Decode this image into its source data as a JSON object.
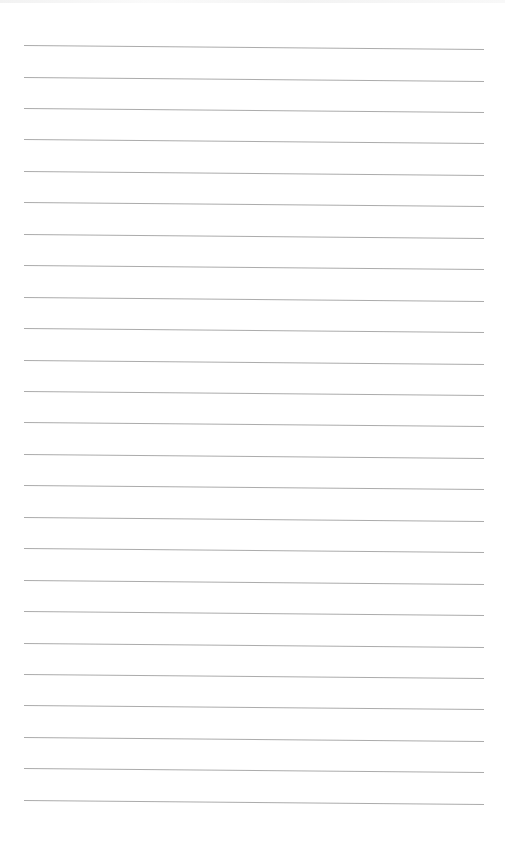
{
  "page": {
    "type": "lined-paper",
    "background": "#ffffff",
    "line_color": "#9c9c9c",
    "line_count": 25,
    "line_left_x": 24,
    "line_right_x": 484,
    "first_line_y": 45,
    "line_spacing": 31.45,
    "slope_px": 4,
    "text": ""
  }
}
